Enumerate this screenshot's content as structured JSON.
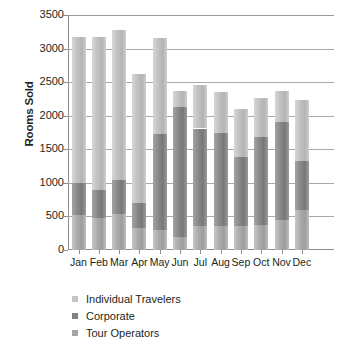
{
  "chart_data": {
    "type": "bar",
    "subtype": "stacked-column",
    "title": "",
    "xlabel": "",
    "ylabel": "Rooms Sold",
    "ylim": [
      0,
      3500
    ],
    "yticks": [
      0,
      500,
      1000,
      1500,
      2000,
      2500,
      3000,
      3500
    ],
    "ytick_labels": [
      "0",
      "500",
      "1000",
      "1500",
      "2000",
      "2500",
      "3000",
      "3500"
    ],
    "grid": true,
    "legend_position": "bottom-left",
    "categories": [
      "Jan",
      "Feb",
      "Mar",
      "Apr",
      "May",
      "Jun",
      "Jul",
      "Aug",
      "Sep",
      "Oct",
      "Nov",
      "Dec"
    ],
    "series": [
      {
        "name": "Tour Operators",
        "color": "#a5a5a5",
        "values": [
          520,
          480,
          540,
          330,
          300,
          200,
          360,
          360,
          360,
          380,
          450,
          600
        ]
      },
      {
        "name": "Corporate",
        "color": "#828282",
        "values": [
          480,
          420,
          510,
          370,
          1430,
          1930,
          1450,
          1380,
          1030,
          1300,
          1460,
          720
        ]
      },
      {
        "name": "Individual Travelers",
        "color": "#c4c4c4",
        "values": [
          2180,
          2270,
          2220,
          1925,
          1430,
          245,
          645,
          620,
          710,
          580,
          465,
          910
        ]
      }
    ],
    "totals": [
      3180,
      3170,
      3270,
      2625,
      3160,
      2375,
      2455,
      2360,
      2100,
      2260,
      2375,
      2230
    ]
  },
  "axis": {
    "y_title": "Rooms Sold"
  },
  "legend": {
    "items": [
      {
        "label": "Individual Travelers",
        "color": "#c4c4c4"
      },
      {
        "label": "Corporate",
        "color": "#828282"
      },
      {
        "label": "Tour Operators",
        "color": "#a5a5a5"
      }
    ]
  }
}
